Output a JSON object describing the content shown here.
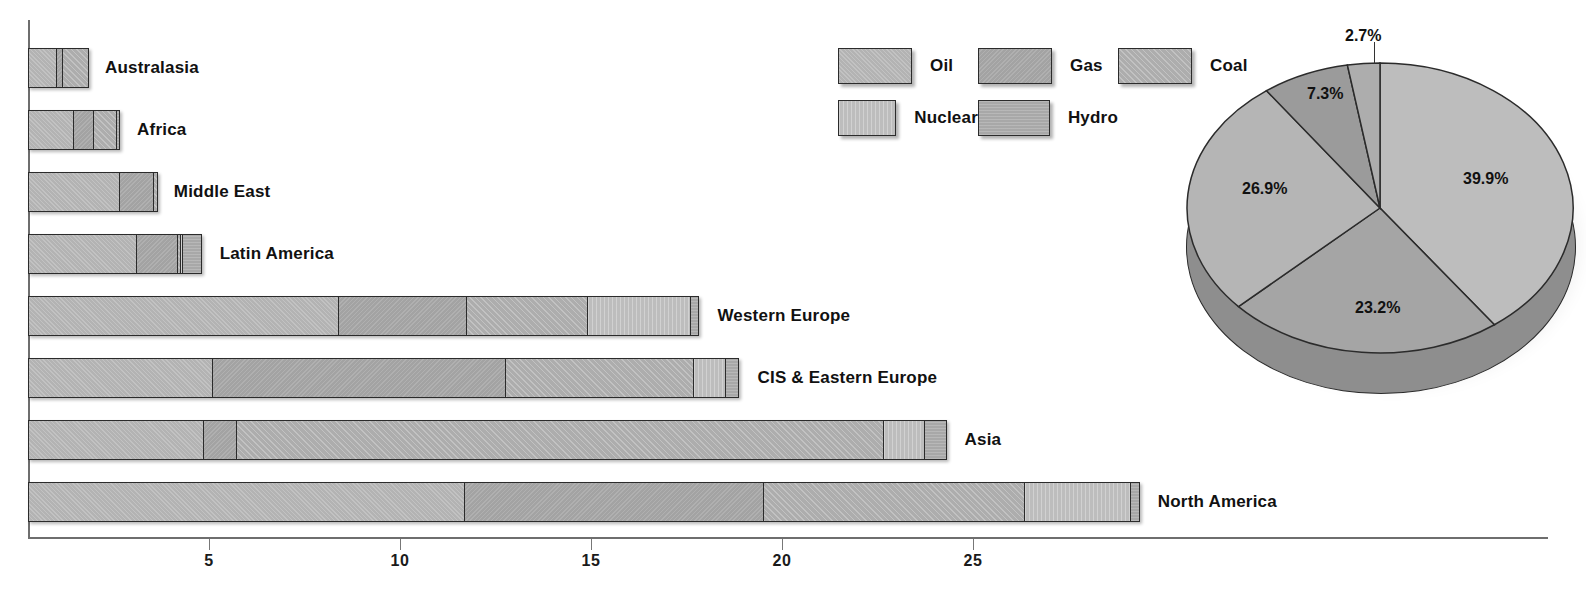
{
  "chart_data": [
    {
      "type": "bar",
      "orientation": "horizontal",
      "stacked": true,
      "title": "",
      "xlabel": "",
      "ylabel": "",
      "xlim": [
        0,
        29
      ],
      "xticks": [
        5,
        10,
        15,
        20,
        25
      ],
      "xtick_labels": [
        "5",
        "10",
        "15",
        "20",
        "25"
      ],
      "grid": false,
      "categories": [
        "Australasia",
        "Africa",
        "Middle East",
        "Latin America",
        "Western Europe",
        "CIS & Eastern Europe",
        "Asia",
        "North America"
      ],
      "series": [
        {
          "name": "Oil",
          "values": [
            0.75,
            1.2,
            2.4,
            2.85,
            8.15,
            4.85,
            4.6,
            11.45
          ]
        },
        {
          "name": "Gas",
          "values": [
            0.18,
            0.55,
            0.92,
            1.1,
            3.37,
            7.7,
            0.9,
            7.85
          ]
        },
        {
          "name": "Coal",
          "values": [
            0.72,
            0.62,
            0.13,
            0.1,
            3.2,
            4.95,
            16.95,
            6.85
          ]
        },
        {
          "name": "Nuclear",
          "values": [
            0.0,
            0.0,
            0.0,
            0.08,
            2.72,
            0.84,
            1.12,
            2.8
          ]
        },
        {
          "name": "Hydro",
          "values": [
            0.0,
            0.12,
            0.0,
            0.52,
            0.24,
            0.39,
            0.58,
            0.26
          ]
        }
      ]
    },
    {
      "type": "pie",
      "title": "",
      "labels": [
        "Oil",
        "Gas",
        "Coal",
        "Nuclear",
        "Hydro"
      ],
      "values": [
        39.9,
        23.2,
        26.9,
        7.3,
        2.7
      ],
      "value_labels": [
        "39.9%",
        "23.2%",
        "26.9%",
        "7.3%",
        "2.7%"
      ],
      "three_d": true,
      "start_angle_deg": 0,
      "direction": "clockwise"
    }
  ],
  "legend": {
    "position": "top-center",
    "rows": [
      [
        {
          "label": "Oil",
          "key": "oil"
        },
        {
          "label": "Gas",
          "key": "gas"
        },
        {
          "label": "Coal",
          "key": "coal"
        }
      ],
      [
        {
          "label": "Nuclear",
          "key": "nuclear"
        },
        {
          "label": "Hydro",
          "key": "hydro"
        }
      ]
    ]
  },
  "colors": {
    "oil": "#b3b3b3",
    "gas": "#a3a3a3",
    "coal": "#adadad",
    "nuclear": "#bdbdbd",
    "hydro": "#a8a8a8",
    "outline": "#2b2b2b",
    "axis": "#6e6e6e",
    "text": "#111111",
    "pie_side": "#8e8e8e",
    "background": "#ffffff"
  },
  "bar_labels": {
    "0": "Australasia",
    "1": "Africa",
    "2": "Middle East",
    "3": "Latin America",
    "4": "Western Europe",
    "5": "CIS & Eastern Europe",
    "6": "Asia",
    "7": "North America"
  },
  "axis_tick_labels": {
    "0": "5",
    "1": "10",
    "2": "15",
    "3": "20",
    "4": "25"
  },
  "pie_labels": {
    "0": "39.9%",
    "1": "23.2%",
    "2": "26.9%",
    "3": "7.3%",
    "4": "2.7%"
  },
  "legend_labels": {
    "oil": "Oil",
    "gas": "Gas",
    "coal": "Coal",
    "nuclear": "Nuclear",
    "hydro": "Hydro"
  }
}
